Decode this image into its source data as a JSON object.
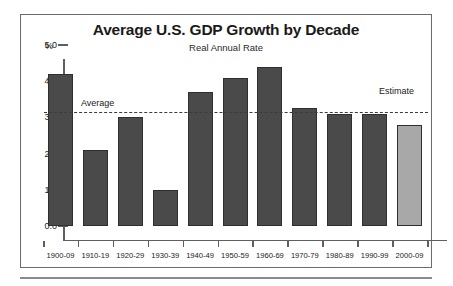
{
  "chart_data": {
    "type": "bar",
    "title": "Average U.S. GDP Growth by Decade",
    "subtitle": "Real Annual Rate",
    "xlabel": "",
    "ylabel": "%",
    "ylim": [
      0.0,
      5.0
    ],
    "grid": false,
    "legend": "none",
    "categories": [
      "1900-09",
      "1910-19",
      "1920-29",
      "1930-39",
      "1940-49",
      "1950-59",
      "1960-69",
      "1970-79",
      "1980-89",
      "1990-99",
      "2000-09"
    ],
    "values": [
      4.2,
      2.1,
      3.0,
      1.0,
      3.7,
      4.1,
      4.4,
      3.25,
      3.1,
      3.1,
      2.8
    ],
    "ytick_labels": [
      "0.0",
      "1.0",
      "2.0",
      "3.0",
      "4.0",
      "5.0"
    ],
    "ytick_values": [
      0.0,
      1.0,
      2.0,
      3.0,
      4.0,
      5.0
    ],
    "annotations": [
      {
        "text": "Average",
        "value": 3.15,
        "kind": "dashed-reference-line"
      },
      {
        "text": "Estimate",
        "kind": "series-callout",
        "category": "2000-09"
      }
    ],
    "series_colors": {
      "actual": "#4a4a4a",
      "estimate": "#a8a8a8"
    },
    "estimate_categories": [
      "2000-09"
    ]
  },
  "labels": {
    "title": "Average U.S. GDP Growth by Decade",
    "subtitle": "Real Annual Rate",
    "y_unit": "%",
    "average": "Average",
    "estimate": "Estimate"
  }
}
